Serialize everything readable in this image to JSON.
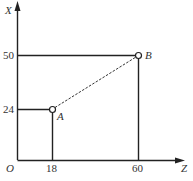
{
  "axes": {
    "x_axis_label": "Z",
    "y_axis_label": "X",
    "origin_label": "O",
    "x_ticks": [
      "18",
      "60"
    ],
    "y_ticks": [
      "24",
      "50"
    ]
  },
  "points": [
    {
      "label": "A",
      "z": 18,
      "x": 24
    },
    {
      "label": "B",
      "z": 60,
      "x": 50
    }
  ],
  "colors": {
    "line": "#222222",
    "text": "#333333",
    "background": "#ffffff"
  }
}
